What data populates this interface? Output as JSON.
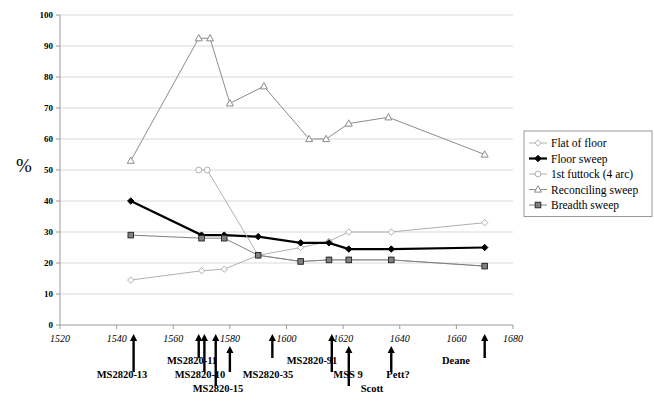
{
  "chart_data": {
    "type": "line",
    "title": "",
    "xlabel": "",
    "ylabel": "%",
    "xlim": [
      1520,
      1680
    ],
    "ylim": [
      0,
      100
    ],
    "xticks": [
      1520,
      1540,
      1560,
      1580,
      1600,
      1620,
      1640,
      1660,
      1680
    ],
    "yticks": [
      0,
      10,
      20,
      30,
      40,
      50,
      60,
      70,
      80,
      90,
      100
    ],
    "grid": true,
    "legend_position": "right",
    "series": [
      {
        "name": "Flat of floor",
        "marker": "open-diamond",
        "color": "#b0b0b0",
        "points": [
          {
            "x": 1545,
            "y": 14.5
          },
          {
            "x": 1570,
            "y": 17.5
          },
          {
            "x": 1578,
            "y": 18
          },
          {
            "x": 1590,
            "y": 22.5
          },
          {
            "x": 1605,
            "y": 25
          },
          {
            "x": 1615,
            "y": 27
          },
          {
            "x": 1622,
            "y": 30
          },
          {
            "x": 1637,
            "y": 30
          },
          {
            "x": 1670,
            "y": 33
          }
        ]
      },
      {
        "name": "Floor sweep",
        "marker": "filled-diamond",
        "color": "#000000",
        "points": [
          {
            "x": 1545,
            "y": 40
          },
          {
            "x": 1570,
            "y": 29
          },
          {
            "x": 1578,
            "y": 29
          },
          {
            "x": 1590,
            "y": 28.5
          },
          {
            "x": 1605,
            "y": 26.5
          },
          {
            "x": 1615,
            "y": 26.5
          },
          {
            "x": 1622,
            "y": 24.5
          },
          {
            "x": 1637,
            "y": 24.5
          },
          {
            "x": 1670,
            "y": 25
          }
        ]
      },
      {
        "name": "1st futtock (4 arc)",
        "marker": "open-circle",
        "color": "#b0b0b0",
        "points": [
          {
            "x": 1569,
            "y": 50
          },
          {
            "x": 1572,
            "y": 50
          },
          {
            "x": 1590,
            "y": 22.5
          },
          {
            "x": 1605,
            "y": 20.5
          },
          {
            "x": 1615,
            "y": 21
          },
          {
            "x": 1622,
            "y": 21
          },
          {
            "x": 1637,
            "y": 21
          },
          {
            "x": 1670,
            "y": 19
          }
        ]
      },
      {
        "name": "Reconciling sweep",
        "marker": "open-triangle",
        "color": "#8c8c8c",
        "points": [
          {
            "x": 1545,
            "y": 53
          },
          {
            "x": 1569,
            "y": 92.5
          },
          {
            "x": 1573,
            "y": 92.5
          },
          {
            "x": 1580,
            "y": 71.5
          },
          {
            "x": 1592,
            "y": 77
          },
          {
            "x": 1608,
            "y": 60
          },
          {
            "x": 1614,
            "y": 60
          },
          {
            "x": 1622,
            "y": 65
          },
          {
            "x": 1636,
            "y": 67
          },
          {
            "x": 1670,
            "y": 55
          }
        ]
      },
      {
        "name": "Breadth sweep",
        "marker": "filled-square",
        "color": "#808080",
        "points": [
          {
            "x": 1545,
            "y": 29
          },
          {
            "x": 1570,
            "y": 28
          },
          {
            "x": 1578,
            "y": 28
          },
          {
            "x": 1590,
            "y": 22.5
          },
          {
            "x": 1605,
            "y": 20.5
          },
          {
            "x": 1615,
            "y": 21
          },
          {
            "x": 1622,
            "y": 21
          },
          {
            "x": 1637,
            "y": 21
          },
          {
            "x": 1670,
            "y": 19
          }
        ]
      }
    ],
    "annotations": [
      {
        "label": "MS2820-13",
        "x": 1546,
        "label_x": 122,
        "label_y": 378,
        "arrow_top": 334,
        "arrow_bottom": 372
      },
      {
        "label": "MS2820-11",
        "x": 1569,
        "label_x": 192,
        "label_y": 364,
        "arrow_top": 334,
        "arrow_bottom": 358
      },
      {
        "label": "MS2820-10",
        "x": 1571,
        "label_x": 200,
        "label_y": 378,
        "arrow_top": 334,
        "arrow_bottom": 372
      },
      {
        "label": "MS2820-15",
        "x": 1575,
        "label_x": 218,
        "label_y": 392,
        "arrow_top": 334,
        "arrow_bottom": 386
      },
      {
        "label": "MS2820-35",
        "x": 1580,
        "label_x": 268,
        "label_y": 378,
        "arrow_top": 346,
        "arrow_bottom": 372
      },
      {
        "label": "MS2820-91",
        "x": 1595,
        "label_x": 312,
        "label_y": 364,
        "arrow_top": 334,
        "arrow_bottom": 358
      },
      {
        "label": "MSS 9",
        "x": 1616,
        "label_x": 348,
        "label_y": 378,
        "arrow_top": 334,
        "arrow_bottom": 372
      },
      {
        "label": "Scott",
        "x": 1622,
        "label_x": 372,
        "label_y": 392,
        "arrow_top": 346,
        "arrow_bottom": 386
      },
      {
        "label": "Pett?",
        "x": 1637,
        "label_x": 398,
        "label_y": 378,
        "arrow_top": 346,
        "arrow_bottom": 372
      },
      {
        "label": "Deane",
        "x": 1670,
        "label_x": 456,
        "label_y": 364,
        "arrow_top": 334,
        "arrow_bottom": 358
      }
    ]
  },
  "legend": {
    "items": [
      {
        "label": "Flat of floor",
        "marker": "open-diamond",
        "color": "#b0b0b0"
      },
      {
        "label": "Floor sweep",
        "marker": "filled-diamond",
        "color": "#000000"
      },
      {
        "label": "1st futtock (4 arc)",
        "marker": "open-circle",
        "color": "#b0b0b0"
      },
      {
        "label": "Reconciling sweep",
        "marker": "open-triangle",
        "color": "#8c8c8c"
      },
      {
        "label": "Breadth sweep",
        "marker": "filled-square",
        "color": "#808080"
      }
    ]
  }
}
